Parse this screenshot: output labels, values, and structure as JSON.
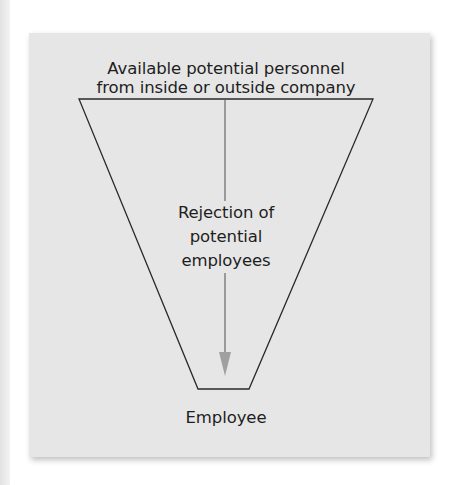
{
  "diagram": {
    "type": "funnel",
    "top_label_line1": "Available potential personnel",
    "top_label_line2": "from inside or outside company",
    "middle_label_line1": "Rejection of",
    "middle_label_line2": "potential",
    "middle_label_line3": "employees",
    "bottom_label": "Employee",
    "colors": {
      "panel_background": "#e6e6e6",
      "funnel_stroke": "#2a2a2a",
      "arrow": "#9a9a9a",
      "text": "#1e1e1e"
    }
  }
}
